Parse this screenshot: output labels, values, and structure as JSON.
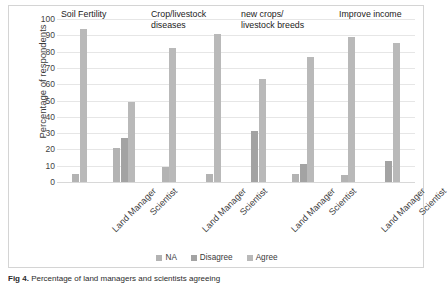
{
  "figure": {
    "caption_bold": "Fig 4.",
    "caption_text": "Percentage of land managers and scientists agreeing"
  },
  "chart_data": {
    "type": "bar",
    "title": "",
    "xlabel": "",
    "ylabel": "Percentage of respondents",
    "ylim": [
      0,
      100
    ],
    "ytick_labels": [
      "100",
      "90",
      "80",
      "70",
      "60",
      "50",
      "40",
      "30",
      "20",
      "10",
      "0"
    ],
    "yticks": [
      100,
      90,
      80,
      70,
      60,
      50,
      40,
      30,
      20,
      10,
      0
    ],
    "grid": true,
    "legend_position": "bottom",
    "legend": [
      "NA",
      "Disagree",
      "Agree"
    ],
    "series_colors": {
      "NA": "#b3b3b3",
      "Disagree": "#a3a3a3",
      "Agree": "#b9b9b9"
    },
    "group_titles": [
      "Soil Fertility",
      "Crop/livestock\ndiseases",
      "new crops/\nlivestock breeds",
      "Improve income"
    ],
    "categories": [
      "Land Manager",
      "Scientist",
      "Land Manager",
      "Scientist",
      "Land Manager",
      "Scientist",
      "Land Manager",
      "Scientist"
    ],
    "series": [
      {
        "name": "NA",
        "values": [
          5,
          21,
          9,
          5,
          0,
          5,
          4,
          0
        ]
      },
      {
        "name": "Disagree",
        "values": [
          0,
          27,
          0,
          0,
          31,
          11,
          0,
          13
        ]
      },
      {
        "name": "Agree",
        "values": [
          94,
          49,
          82,
          91,
          63,
          77,
          89,
          85
        ]
      }
    ]
  }
}
